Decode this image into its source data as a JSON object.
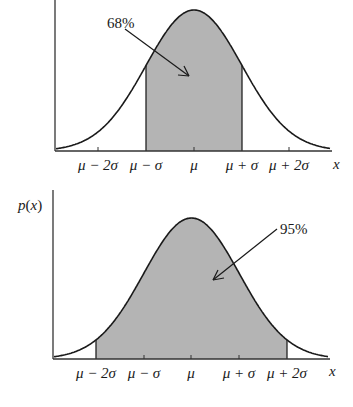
{
  "chart_data": [
    {
      "type": "area",
      "title": "",
      "description": "Normal distribution; shaded area between mu-sigma and mu+sigma",
      "xlabel": "x",
      "ylabel": "",
      "tick_labels": [
        "μ − 2σ",
        "μ − σ",
        "μ",
        "μ + σ",
        "μ + 2σ"
      ],
      "shaded_range": [
        "μ − σ",
        "μ + σ"
      ],
      "annotation": "68%",
      "grid": false,
      "fill_color": "#b4b4b4"
    },
    {
      "type": "area",
      "title": "",
      "description": "Normal distribution; shaded area between mu-2sigma and mu+2sigma",
      "xlabel": "x",
      "ylabel": "p(x)",
      "tick_labels": [
        "μ − 2σ",
        "μ − σ",
        "μ",
        "μ + σ",
        "μ + 2σ"
      ],
      "shaded_range": [
        "μ − 2σ",
        "μ + 2σ"
      ],
      "annotation": "95%",
      "grid": false,
      "fill_color": "#b4b4b4"
    }
  ],
  "top": {
    "annotation": "68%",
    "xlabel": "x",
    "ticks": [
      "μ − 2σ",
      "μ − σ",
      "μ",
      "μ + σ",
      "μ + 2σ"
    ]
  },
  "bottom": {
    "annotation": "95%",
    "ylabel_p": "p",
    "ylabel_rest": "(",
    "ylabel_x": "x",
    "ylabel_close": ")",
    "xlabel": "x",
    "ticks": [
      "μ − 2σ",
      "μ − σ",
      "μ",
      "μ + σ",
      "μ + 2σ"
    ]
  }
}
